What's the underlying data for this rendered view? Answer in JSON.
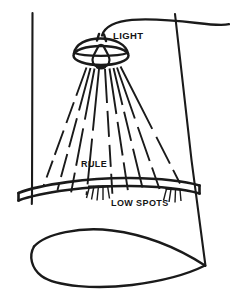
{
  "diagram": {
    "type": "technical-line-illustration",
    "background_color": "#ffffff",
    "ink_color": "#1a1a1a",
    "labels": {
      "light": "LIGHT",
      "rule": "RULE",
      "low_spots": "LOW SPOTS"
    },
    "parts": {
      "lamp": {
        "name": "hanging drop light",
        "shade_shape": "dome with elliptical rim",
        "bulb_shape": "teardrop pear bulb",
        "cord": "arcs up and to the right past the wall edge"
      },
      "rays": {
        "name": "light rays",
        "style": "dashed straight lines radiating downward",
        "left_count": 4,
        "right_count": 5,
        "total_count": 9
      },
      "rule": {
        "name": "straightedge rule",
        "shape": "long slightly bowed bar lying across the surface",
        "orientation": "horizontal, spanning the work surface"
      },
      "low_spots": {
        "name": "low spot hatching",
        "style": "short slanted hatch strokes beneath the rule",
        "cluster_count": 2,
        "left_cluster_marks": 5,
        "right_cluster_marks": 4
      },
      "surface": {
        "name": "work surface",
        "shape": "tapering panel with curved swept bottom edge",
        "left_edge": "vertical line",
        "right_edge": "slanted line converging to lower right point"
      }
    }
  }
}
